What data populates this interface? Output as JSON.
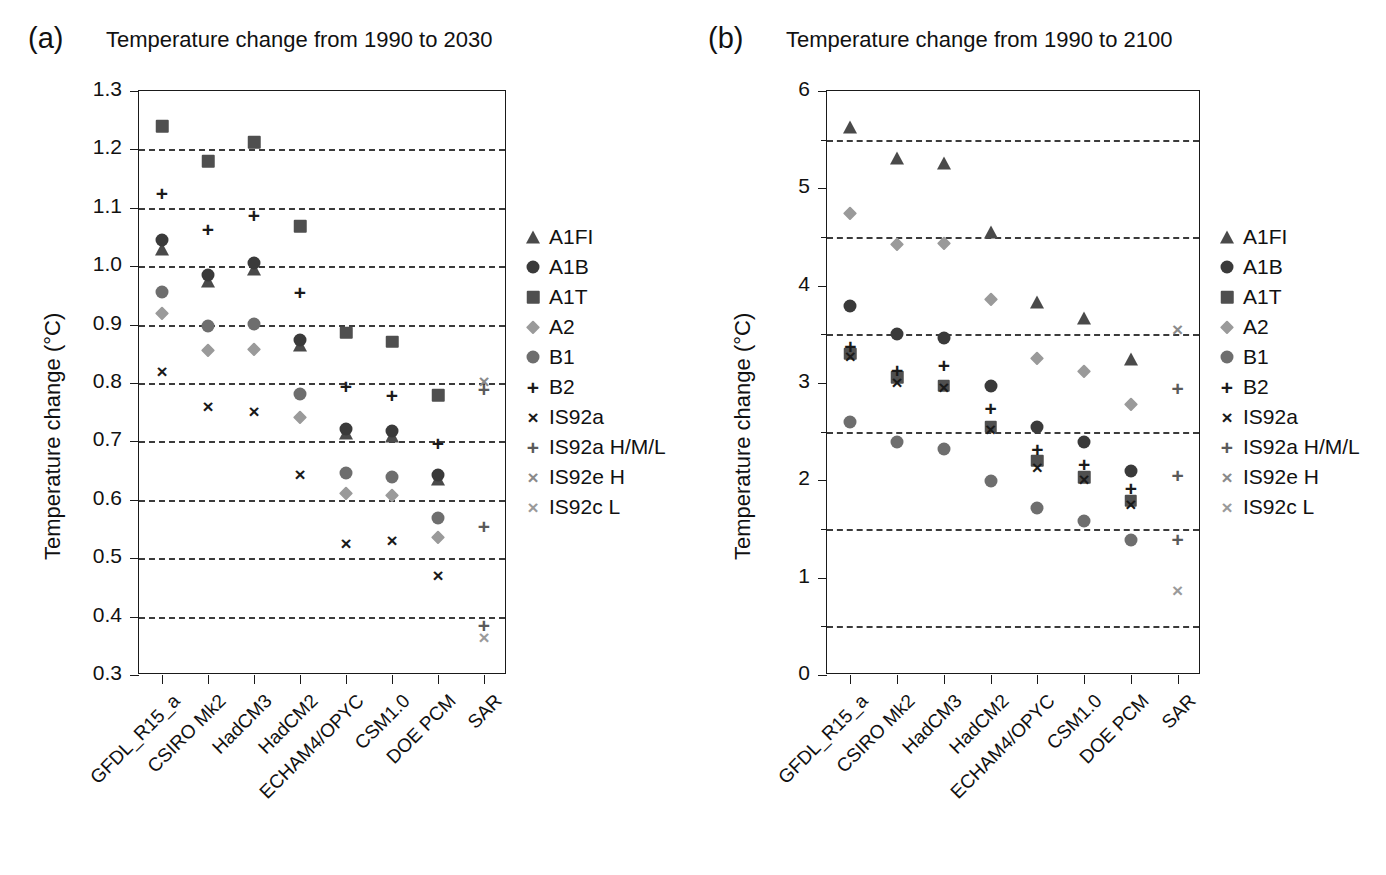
{
  "figure": {
    "background": "#ffffff",
    "panels": [
      "a",
      "b"
    ]
  },
  "panel_a": {
    "tag": "(a)",
    "title": "Temperature change from 1990 to 2030"
  },
  "panel_b": {
    "tag": "(b)",
    "title": "Temperature change from 1990 to 2100"
  },
  "legend": {
    "entries": [
      {
        "label": "A1FI",
        "marker": "triangle",
        "color": "#4a4a4a"
      },
      {
        "label": "A1B",
        "marker": "circle",
        "color": "#3a3a3a"
      },
      {
        "label": "A1T",
        "marker": "square",
        "color": "#4f4f4f"
      },
      {
        "label": "A2",
        "marker": "diamond",
        "color": "#9a9a9a"
      },
      {
        "label": "B1",
        "marker": "circle",
        "color": "#6e6e6e"
      },
      {
        "label": "B2",
        "marker": "plus",
        "color": "#1a1a1a"
      },
      {
        "label": "IS92a",
        "marker": "cross",
        "color": "#1a1a1a"
      },
      {
        "label": "IS92a H/M/L",
        "marker": "plus",
        "color": "#5a5a5a"
      },
      {
        "label": "IS92e H",
        "marker": "cross",
        "color": "#8a8a8a"
      },
      {
        "label": "IS92c L",
        "marker": "cross",
        "color": "#9a9a9a"
      }
    ]
  },
  "chart_data": [
    {
      "type": "scatter",
      "panel": "a",
      "title": "Temperature change from 1990 to 2030",
      "xlabel": "",
      "ylabel": "Temperature change (°C)",
      "ylim": [
        0.3,
        1.3
      ],
      "ytick_step": 0.1,
      "yticks": [
        0.3,
        0.4,
        0.5,
        0.6,
        0.7,
        0.8,
        0.9,
        1.0,
        1.1,
        1.2,
        1.3
      ],
      "ytick_labels": [
        "0.3",
        "0.4",
        "0.5",
        "0.6",
        "0.7",
        "0.8",
        "0.9",
        "1.0",
        "1.1",
        "1.2",
        "1.3"
      ],
      "gridlines": [
        0.4,
        0.5,
        0.6,
        0.7,
        0.8,
        0.9,
        1.0,
        1.1,
        1.2
      ],
      "grid": true,
      "legend_position": "right",
      "categories": [
        "GFDL_R15_a",
        "CSIRO Mk2",
        "HadCM3",
        "HadCM2",
        "ECHAM4/OPYC",
        "CSM1.0",
        "DOE PCM",
        "SAR"
      ],
      "series": [
        {
          "name": "A1FI",
          "marker": "triangle",
          "color": "#4a4a4a",
          "values": [
            1.03,
            0.975,
            0.995,
            0.865,
            0.715,
            0.71,
            0.635,
            null
          ]
        },
        {
          "name": "A1B",
          "marker": "circle",
          "color": "#3a3a3a",
          "values": [
            1.045,
            0.985,
            1.005,
            0.873,
            0.722,
            0.718,
            0.643,
            null
          ]
        },
        {
          "name": "A1T",
          "marker": "square",
          "color": "#4f4f4f",
          "values": [
            1.24,
            1.18,
            1.212,
            1.068,
            0.886,
            0.871,
            0.779,
            null
          ]
        },
        {
          "name": "A2",
          "marker": "diamond",
          "color": "#9a9a9a",
          "values": [
            0.92,
            0.857,
            0.859,
            0.742,
            0.612,
            0.609,
            0.536,
            null
          ]
        },
        {
          "name": "B1",
          "marker": "circle",
          "color": "#6e6e6e",
          "values": [
            0.955,
            0.897,
            0.901,
            0.781,
            0.646,
            0.639,
            0.568,
            null
          ]
        },
        {
          "name": "B2",
          "marker": "plus",
          "color": "#1a1a1a",
          "values": [
            1.125,
            1.064,
            1.087,
            0.955,
            0.795,
            0.779,
            0.697,
            null
          ]
        },
        {
          "name": "IS92a",
          "marker": "cross",
          "color": "#1a1a1a",
          "values": [
            0.82,
            0.761,
            0.752,
            0.645,
            0.526,
            0.531,
            0.471,
            null
          ]
        },
        {
          "name": "IS92a H/M/L",
          "marker": "plus",
          "color": "#5a5a5a",
          "values": [
            null,
            null,
            null,
            null,
            null,
            null,
            null,
            [
              0.79,
              0.555,
              0.386
            ]
          ]
        },
        {
          "name": "IS92e H",
          "marker": "cross",
          "color": "#8a8a8a",
          "values": [
            null,
            null,
            null,
            null,
            null,
            null,
            null,
            0.803
          ]
        },
        {
          "name": "IS92c L",
          "marker": "cross",
          "color": "#9a9a9a",
          "values": [
            null,
            null,
            null,
            null,
            null,
            null,
            null,
            0.365
          ]
        }
      ]
    },
    {
      "type": "scatter",
      "panel": "b",
      "title": "Temperature change from 1990 to 2100",
      "xlabel": "",
      "ylabel": "Temperature change (°C)",
      "ylim": [
        0,
        6
      ],
      "ytick_step": 1,
      "yticks": [
        0,
        1,
        2,
        3,
        4,
        5,
        6
      ],
      "ytick_labels": [
        "0",
        "1",
        "2",
        "3",
        "4",
        "5",
        "6"
      ],
      "gridlines": [
        0.5,
        1.5,
        2.5,
        3.5,
        4.5,
        5.5
      ],
      "grid": true,
      "legend_position": "right",
      "categories": [
        "GFDL_R15_a",
        "CSIRO Mk2",
        "HadCM3",
        "HadCM2",
        "ECHAM4/OPYC",
        "CSM1.0",
        "DOE PCM",
        "SAR"
      ],
      "series": [
        {
          "name": "A1FI",
          "marker": "triangle",
          "color": "#4a4a4a",
          "values": [
            5.63,
            5.31,
            5.26,
            4.55,
            3.83,
            3.67,
            3.25,
            null
          ]
        },
        {
          "name": "A1B",
          "marker": "circle",
          "color": "#3a3a3a",
          "values": [
            3.79,
            3.5,
            3.46,
            2.97,
            2.55,
            2.39,
            2.1,
            null
          ]
        },
        {
          "name": "A1T",
          "marker": "square",
          "color": "#4f4f4f",
          "values": [
            3.3,
            3.06,
            2.97,
            2.55,
            2.2,
            2.03,
            1.79,
            null
          ]
        },
        {
          "name": "A2",
          "marker": "diamond",
          "color": "#9a9a9a",
          "values": [
            4.75,
            4.43,
            4.44,
            3.86,
            3.26,
            3.12,
            2.78,
            null
          ]
        },
        {
          "name": "B1",
          "marker": "circle",
          "color": "#6e6e6e",
          "values": [
            2.6,
            2.39,
            2.32,
            1.99,
            1.72,
            1.58,
            1.39,
            null
          ]
        },
        {
          "name": "B2",
          "marker": "plus",
          "color": "#1a1a1a",
          "values": [
            3.38,
            3.13,
            3.18,
            2.74,
            2.32,
            2.17,
            1.92,
            null
          ]
        },
        {
          "name": "IS92a",
          "marker": "cross",
          "color": "#1a1a1a",
          "values": [
            3.28,
            3.01,
            2.96,
            2.53,
            2.14,
            2.01,
            1.76,
            null
          ]
        },
        {
          "name": "IS92a H/M/L",
          "marker": "plus",
          "color": "#5a5a5a",
          "values": [
            null,
            null,
            null,
            null,
            null,
            null,
            null,
            [
              2.95,
              2.05,
              1.4
            ]
          ]
        },
        {
          "name": "IS92e H",
          "marker": "cross",
          "color": "#8a8a8a",
          "values": [
            null,
            null,
            null,
            null,
            null,
            null,
            null,
            3.55
          ]
        },
        {
          "name": "IS92c L",
          "marker": "cross",
          "color": "#9a9a9a",
          "values": [
            null,
            null,
            null,
            null,
            null,
            null,
            null,
            0.87
          ]
        }
      ]
    }
  ]
}
